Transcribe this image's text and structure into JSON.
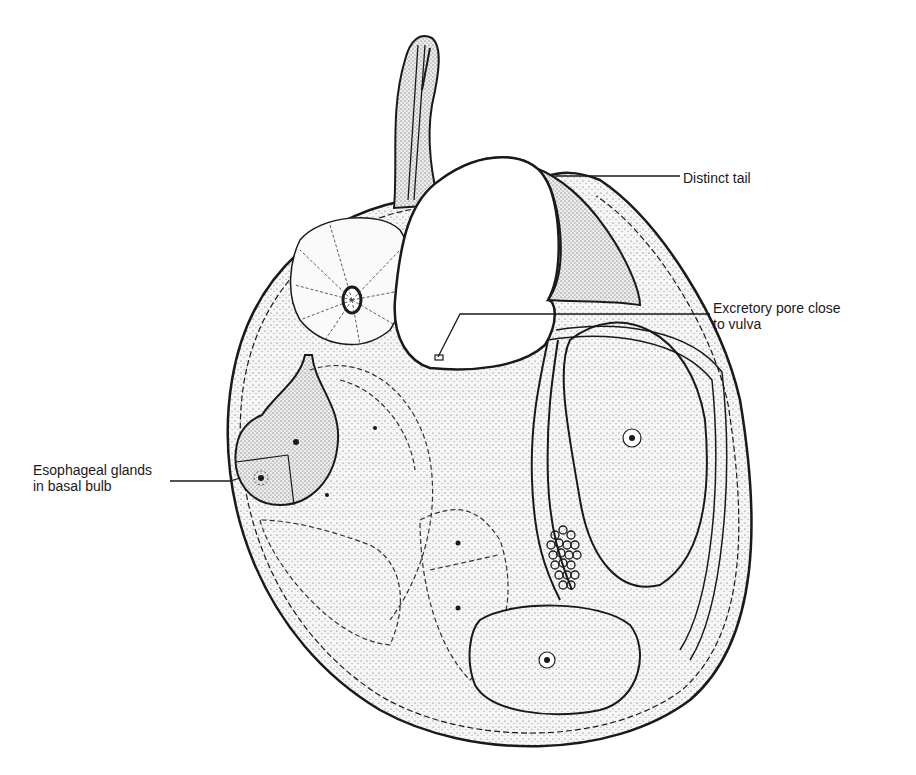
{
  "figure": {
    "line_color": "#1a1a1a",
    "fill_color": "#f2f2f2",
    "background": "#ffffff"
  },
  "labels": {
    "distinct_tail": {
      "line1": "Distinct tail"
    },
    "excretory_pore": {
      "line1": "Excretory pore close",
      "line2": "to vulva"
    },
    "esophageal_glands": {
      "line1": "Esophageal glands",
      "line2": "in basal bulb"
    }
  }
}
